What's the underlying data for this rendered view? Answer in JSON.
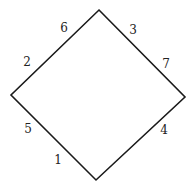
{
  "diagram": {
    "shape": "diamond",
    "stroke_color": "#1a1a1a",
    "vertices": {
      "top": [
        99,
        10
      ],
      "right": [
        185,
        97
      ],
      "bottom": [
        96,
        180
      ],
      "left": [
        11,
        95
      ]
    },
    "labels": [
      {
        "text": "6",
        "x": 64,
        "y": 28,
        "edge": "top-left"
      },
      {
        "text": "2",
        "x": 27,
        "y": 62,
        "edge": "top-left"
      },
      {
        "text": "3",
        "x": 133,
        "y": 30,
        "edge": "top-right"
      },
      {
        "text": "7",
        "x": 166,
        "y": 64,
        "edge": "top-right"
      },
      {
        "text": "5",
        "x": 28,
        "y": 129,
        "edge": "bottom-left"
      },
      {
        "text": "1",
        "x": 58,
        "y": 160,
        "edge": "bottom-left"
      },
      {
        "text": "4",
        "x": 164,
        "y": 130,
        "edge": "bottom-right"
      }
    ]
  }
}
